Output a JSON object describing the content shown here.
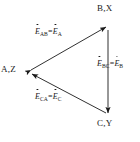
{
  "figure": {
    "type": "triangle-flow-diagram",
    "background_color": "#ffffff",
    "line_color": "#1a1a1a",
    "text_color": "#1a1a1a",
    "vertices": [
      {
        "id": "A",
        "label": "A,Z",
        "x": 30,
        "y": 72
      },
      {
        "id": "B",
        "label": "B,X",
        "x": 108,
        "y": 25
      },
      {
        "id": "C",
        "label": "C,Y",
        "x": 108,
        "y": 115
      }
    ],
    "edges": [
      {
        "id": "AB",
        "from": "A",
        "to": "B",
        "arrowheads": "both",
        "label": {
          "symbol": "E",
          "dot": true,
          "subscript": "AB",
          "equals": "=",
          "symbol2": "E",
          "dot2": true,
          "subscript2": "A"
        }
      },
      {
        "id": "BC",
        "from": "B",
        "to": "C",
        "arrowheads": "end",
        "label": {
          "symbol": "E",
          "dot": true,
          "subscript": "BC",
          "equals": "=",
          "symbol2": "E",
          "dot2": true,
          "subscript2": "B"
        }
      },
      {
        "id": "CA",
        "from": "C",
        "to": "A",
        "arrowheads": "end",
        "label": {
          "symbol": "E",
          "dot": true,
          "subscript": "CA",
          "equals": "=",
          "symbol2": "E",
          "dot2": true,
          "subscript2": "C"
        }
      }
    ]
  }
}
